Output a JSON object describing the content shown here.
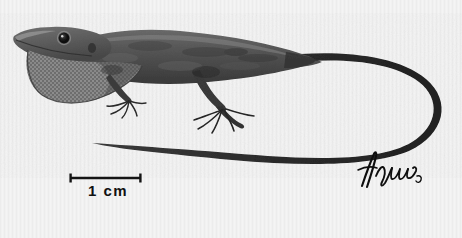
{
  "figure": {
    "kind": "scientific-illustration",
    "medium": "halftone print",
    "background_color": "#f1f1f1",
    "ink_color": "#1a1a1a",
    "body_color": "#5a5a5a",
    "body_shadow_color": "#3b3b3b",
    "dewlap_color": "#6d6d6d",
    "highlight_color": "#c9c9c9",
    "width": 462,
    "height": 238
  },
  "scalebar": {
    "label": "1 cm",
    "x_start": 70,
    "x_end": 141,
    "y": 178,
    "tick_height": 9,
    "line_width": 2.4,
    "color": "#141414"
  },
  "signature": {
    "text": "artist-signature",
    "transcription": "",
    "x": 360,
    "y": 152,
    "color": "#0e0e0e"
  },
  "annotations": {
    "head_label": "head-with-eye-and-snout",
    "dewlap_label": "extended-dewlap-throat-fan",
    "forelimb_label": "forelimb-with-toes",
    "hindlimb_label": "hindlimb-with-toes",
    "tail_label": "long-curving-tail",
    "body_label": "dorsal-body"
  }
}
